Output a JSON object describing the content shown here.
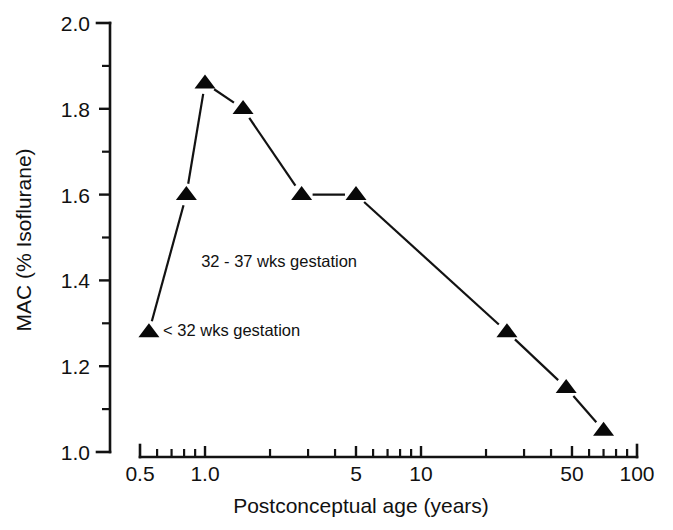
{
  "chart_data": {
    "type": "line",
    "title": "",
    "xlabel": "Postconceptual age (years)",
    "ylabel": "MAC (% Isoflurane)",
    "xscale": "log",
    "yscale": "linear",
    "xlim": [
      0.5,
      100
    ],
    "ylim": [
      1.0,
      2.0
    ],
    "grid": false,
    "legend": "none",
    "marker": "triangle-up",
    "line_color": "#121212",
    "marker_color": "#080808",
    "x": [
      0.55,
      0.82,
      1.0,
      1.5,
      2.8,
      5.0,
      25.0,
      47.0,
      70.0
    ],
    "values": [
      1.28,
      1.6,
      1.86,
      1.8,
      1.6,
      1.6,
      1.28,
      1.15,
      1.05
    ],
    "series": [
      {
        "name": "MAC isoflurane vs postconceptual age",
        "x": [
          0.55,
          0.82,
          1.0,
          1.5,
          2.8,
          5.0,
          25.0,
          47.0,
          70.0
        ],
        "values": [
          1.28,
          1.6,
          1.86,
          1.8,
          1.6,
          1.6,
          1.28,
          1.15,
          1.05
        ]
      }
    ],
    "xticks": [
      {
        "value": 0.5,
        "label": "0.5",
        "major": true
      },
      {
        "value": 0.6,
        "label": "",
        "major": false
      },
      {
        "value": 0.7,
        "label": "",
        "major": false
      },
      {
        "value": 0.8,
        "label": "",
        "major": false
      },
      {
        "value": 0.9,
        "label": "",
        "major": false
      },
      {
        "value": 1.0,
        "label": "1.0",
        "major": true
      },
      {
        "value": 2.0,
        "label": "",
        "major": false
      },
      {
        "value": 3.0,
        "label": "",
        "major": false
      },
      {
        "value": 4.0,
        "label": "",
        "major": false
      },
      {
        "value": 5.0,
        "label": "5",
        "major": true
      },
      {
        "value": 6.0,
        "label": "",
        "major": false
      },
      {
        "value": 7.0,
        "label": "",
        "major": false
      },
      {
        "value": 8.0,
        "label": "",
        "major": false
      },
      {
        "value": 9.0,
        "label": "",
        "major": false
      },
      {
        "value": 10.0,
        "label": "10",
        "major": true
      },
      {
        "value": 20.0,
        "label": "",
        "major": false
      },
      {
        "value": 30.0,
        "label": "",
        "major": false
      },
      {
        "value": 40.0,
        "label": "",
        "major": false
      },
      {
        "value": 50.0,
        "label": "50",
        "major": true
      },
      {
        "value": 60.0,
        "label": "",
        "major": false
      },
      {
        "value": 70.0,
        "label": "",
        "major": false
      },
      {
        "value": 80.0,
        "label": "",
        "major": false
      },
      {
        "value": 90.0,
        "label": "",
        "major": false
      },
      {
        "value": 100.0,
        "label": "100",
        "major": true
      }
    ],
    "yticks": [
      {
        "value": 2.0,
        "label": "2.0",
        "major": true
      },
      {
        "value": 1.9,
        "label": "",
        "major": false
      },
      {
        "value": 1.8,
        "label": "1.8",
        "major": true
      },
      {
        "value": 1.7,
        "label": "",
        "major": false
      },
      {
        "value": 1.6,
        "label": "1.6",
        "major": true
      },
      {
        "value": 1.5,
        "label": "",
        "major": false
      },
      {
        "value": 1.4,
        "label": "1.4",
        "major": true
      },
      {
        "value": 1.3,
        "label": "",
        "major": false
      },
      {
        "value": 1.2,
        "label": "1.2",
        "major": true
      },
      {
        "value": 1.1,
        "label": "",
        "major": false
      },
      {
        "value": 1.0,
        "label": "1.0",
        "major": true
      }
    ],
    "annotations": [
      {
        "text": "32 - 37 wks gestation",
        "point_x": 0.82,
        "point_y": 1.6,
        "anchor_x": 0.9,
        "anchor_y": 1.445
      },
      {
        "text": "< 32 wks gestation",
        "point_x": 0.55,
        "point_y": 1.28,
        "anchor_x": 0.6,
        "anchor_y": 1.285
      }
    ]
  }
}
